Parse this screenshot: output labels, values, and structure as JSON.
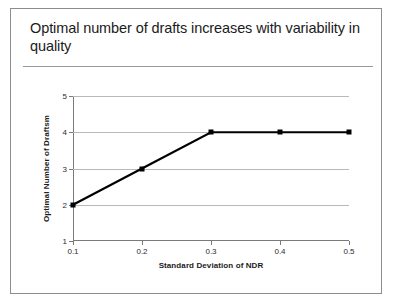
{
  "slide": {
    "title": "Optimal number of drafts increases with variability in quality"
  },
  "chart_data": {
    "type": "line",
    "title": "",
    "xlabel": "Standard Deviation of NDR",
    "ylabel": "Optimal Number of Draftsm",
    "x": [
      0.1,
      0.2,
      0.3,
      0.4,
      0.5
    ],
    "values": [
      2,
      3,
      4,
      4,
      4
    ],
    "xticks": [
      "0.1",
      "0.2",
      "0.3",
      "0.4",
      "0.5"
    ],
    "yticks": [
      "1",
      "2",
      "3",
      "4",
      "5"
    ],
    "xlim": [
      0.1,
      0.5
    ],
    "ylim": [
      1,
      5
    ],
    "grid": true,
    "legend": false,
    "series_color": "#000000",
    "marker": "square",
    "gridline_color": "#b9b9b9"
  }
}
